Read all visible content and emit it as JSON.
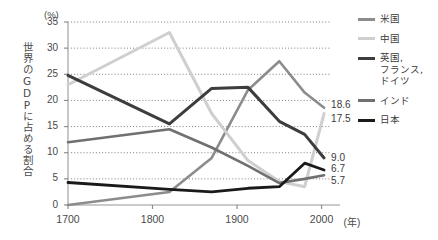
{
  "chart_data": {
    "type": "line",
    "title": "",
    "xlabel": "年",
    "ylabel": "世界のGDPに占める割合",
    "yunit": "(%)",
    "xlim": [
      1700,
      2010
    ],
    "ylim": [
      0,
      35
    ],
    "grid": true,
    "legend_position": "right",
    "x_ticks": [
      "1700",
      "1800",
      "1900",
      "2000"
    ],
    "x_tick_values": [
      1700,
      1800,
      1900,
      2000
    ],
    "y_ticks": [
      "0",
      "5",
      "10",
      "15",
      "20",
      "25",
      "30",
      "35"
    ],
    "y_tick_values": [
      0,
      5,
      10,
      15,
      20,
      25,
      30,
      35
    ],
    "x": [
      1700,
      1820,
      1870,
      1913,
      1950,
      1980,
      2003
    ],
    "series": [
      {
        "name": "米国",
        "color": "#8c8c8c",
        "width": 2.6,
        "values": [
          0.0,
          2.5,
          9.0,
          22.0,
          27.5,
          21.5,
          18.6
        ],
        "end_label": "18.6"
      },
      {
        "name": "中国",
        "color": "#cfcfcf",
        "width": 3.0,
        "values": [
          23.0,
          33.0,
          17.5,
          8.5,
          4.5,
          3.5,
          17.5
        ],
        "end_label": "17.5"
      },
      {
        "name": "英国、\nフランス、\nドイツ",
        "legend_label": "英国,\nフランス,\nドイツ",
        "color": "#3d3d3d",
        "width": 3.0,
        "values": [
          24.8,
          15.5,
          22.3,
          22.5,
          16.0,
          13.5,
          9.0
        ],
        "end_label": "9.0"
      },
      {
        "name": "インド",
        "color": "#707070",
        "width": 2.6,
        "values": [
          12.0,
          14.5,
          11.0,
          7.5,
          4.2,
          5.0,
          5.7
        ],
        "end_label": "5.7"
      },
      {
        "name": "日本",
        "color": "#1a1a1a",
        "width": 2.8,
        "values": [
          4.3,
          3.0,
          2.5,
          3.2,
          3.5,
          8.0,
          6.7
        ],
        "end_label": "6.7"
      }
    ]
  },
  "axis": {
    "y_unit_label": "(%)",
    "y_title": "世界のGDPに占める割合",
    "x_unit_label": "(年)"
  },
  "legend": {
    "items": [
      {
        "label": "米国",
        "color": "#8c8c8c"
      },
      {
        "label": "中国",
        "color": "#cfcfcf"
      },
      {
        "label": "英国,\nフランス,\nドイツ",
        "color": "#3d3d3d"
      },
      {
        "label": "インド",
        "color": "#707070"
      },
      {
        "label": "日本",
        "color": "#1a1a1a"
      }
    ]
  },
  "end_labels": [
    {
      "text": "18.6",
      "value": 18.6
    },
    {
      "text": "17.5",
      "value": 17.5
    },
    {
      "text": "9.0",
      "value": 9.0
    },
    {
      "text": "6.7",
      "value": 6.7
    },
    {
      "text": "5.7",
      "value": 5.7
    }
  ]
}
